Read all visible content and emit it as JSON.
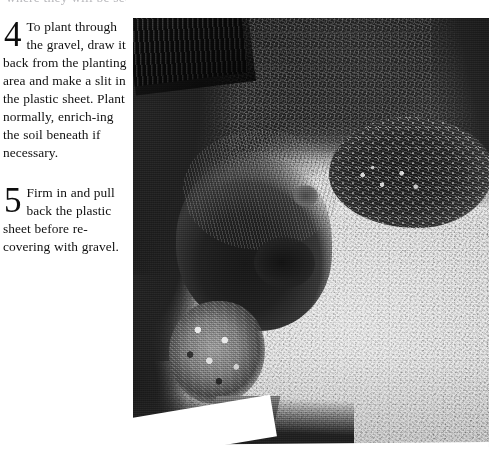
{
  "page": {
    "background_color": "#ffffff",
    "clipped_top_text": "where they will be seen.",
    "photo_caption_present": false
  },
  "steps": [
    {
      "numeral": "4",
      "text": "To plant through the gravel, draw it back from the planting area and make a slit in the plastic sheet. Plant normally, enrich-ing the soil beneath if necessary."
    },
    {
      "numeral": "5",
      "text": "Firm in and pull back the plastic sheet before re-covering with gravel."
    }
  ],
  "photo": {
    "alt": "Black and white overhead photograph of a gravel garden with dark shrub beds, a wooden fence at the upper left, a large shrub clump at centre left, a round planting bed with pale flowers at the right, and a flowering plant at the lower left.",
    "tone": "monochrome",
    "colors": {
      "gravel_light": "#d8d8d8",
      "gravel_mid": "#ababab",
      "foliage_dark": "#222222",
      "shadow_black": "#141414",
      "flower_white": "#f5f5f5"
    }
  }
}
